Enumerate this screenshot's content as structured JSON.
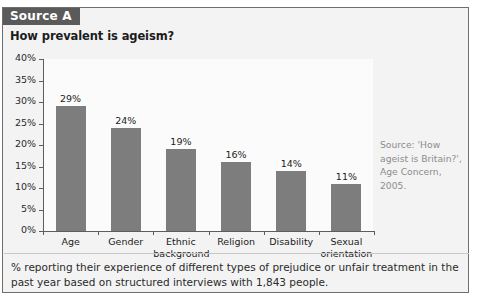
{
  "card": {
    "source_tab": "Source A",
    "title": "How prevalent is ageism?",
    "source_note": "Source: 'How ageist is Britain?', Age Concern, 2005.",
    "caption": "% reporting their experience of different types of prejudice or unfair treatment in the past year based on structured interviews with 1,843 people."
  },
  "colors": {
    "bar": "#7d7d7d",
    "tab_background": "#5a5a5a",
    "card_background": "#f3f3f3",
    "plot_background": "#fbfbfb",
    "axis": "#5d5d5d",
    "source_note_text": "#8c8c8c"
  },
  "chart_data": {
    "type": "bar",
    "title": "How prevalent is ageism?",
    "categories": [
      "Age",
      "Gender",
      "Ethnic background",
      "Religion",
      "Disability",
      "Sexual orientation"
    ],
    "values": [
      29,
      24,
      19,
      16,
      14,
      11
    ],
    "value_labels": [
      "29%",
      "24%",
      "19%",
      "16%",
      "14%",
      "11%"
    ],
    "ytick_labels": [
      "40%",
      "35%",
      "30%",
      "25%",
      "20%",
      "15%",
      "10%",
      "5%",
      "0%"
    ],
    "ytick_values": [
      40,
      35,
      30,
      25,
      20,
      15,
      10,
      5,
      0
    ],
    "ylim": [
      0,
      40
    ],
    "xlabel": "",
    "ylabel": "",
    "grid": false,
    "legend": false
  }
}
